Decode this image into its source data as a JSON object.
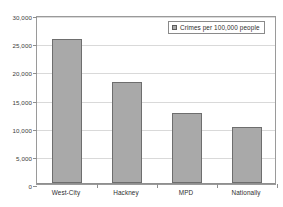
{
  "chart_data": {
    "type": "bar",
    "title": "",
    "xlabel": "",
    "ylabel": "",
    "categories": [
      "West-City",
      "Hackney",
      "MPD",
      "Nationally"
    ],
    "values": [
      25600,
      17900,
      12400,
      9900
    ],
    "series": [
      {
        "name": "Crimes per 100,000 people",
        "values": [
          25600,
          17900,
          12400,
          9900
        ]
      }
    ],
    "ylim": [
      0,
      30000
    ],
    "ytick_values": [
      0,
      5000,
      10000,
      15000,
      20000,
      25000,
      30000
    ],
    "ytick_labels": [
      "0",
      "5,000",
      "10,000",
      "15,000",
      "20,000",
      "25,000",
      "30,000"
    ],
    "grid": true,
    "legend": {
      "position": "top-right",
      "entries": [
        {
          "label": "Crimes per 100,000 people",
          "color": "#a9a9a9"
        }
      ]
    },
    "colors": {
      "bar_fill": "#a9a9a9",
      "bar_border": "#6e6e6e",
      "gridline": "#d9d9d9",
      "axis": "#8f8f8f",
      "plot_border": "#9a9a9a",
      "text": "#2e2e2e",
      "background": "#ffffff"
    }
  }
}
